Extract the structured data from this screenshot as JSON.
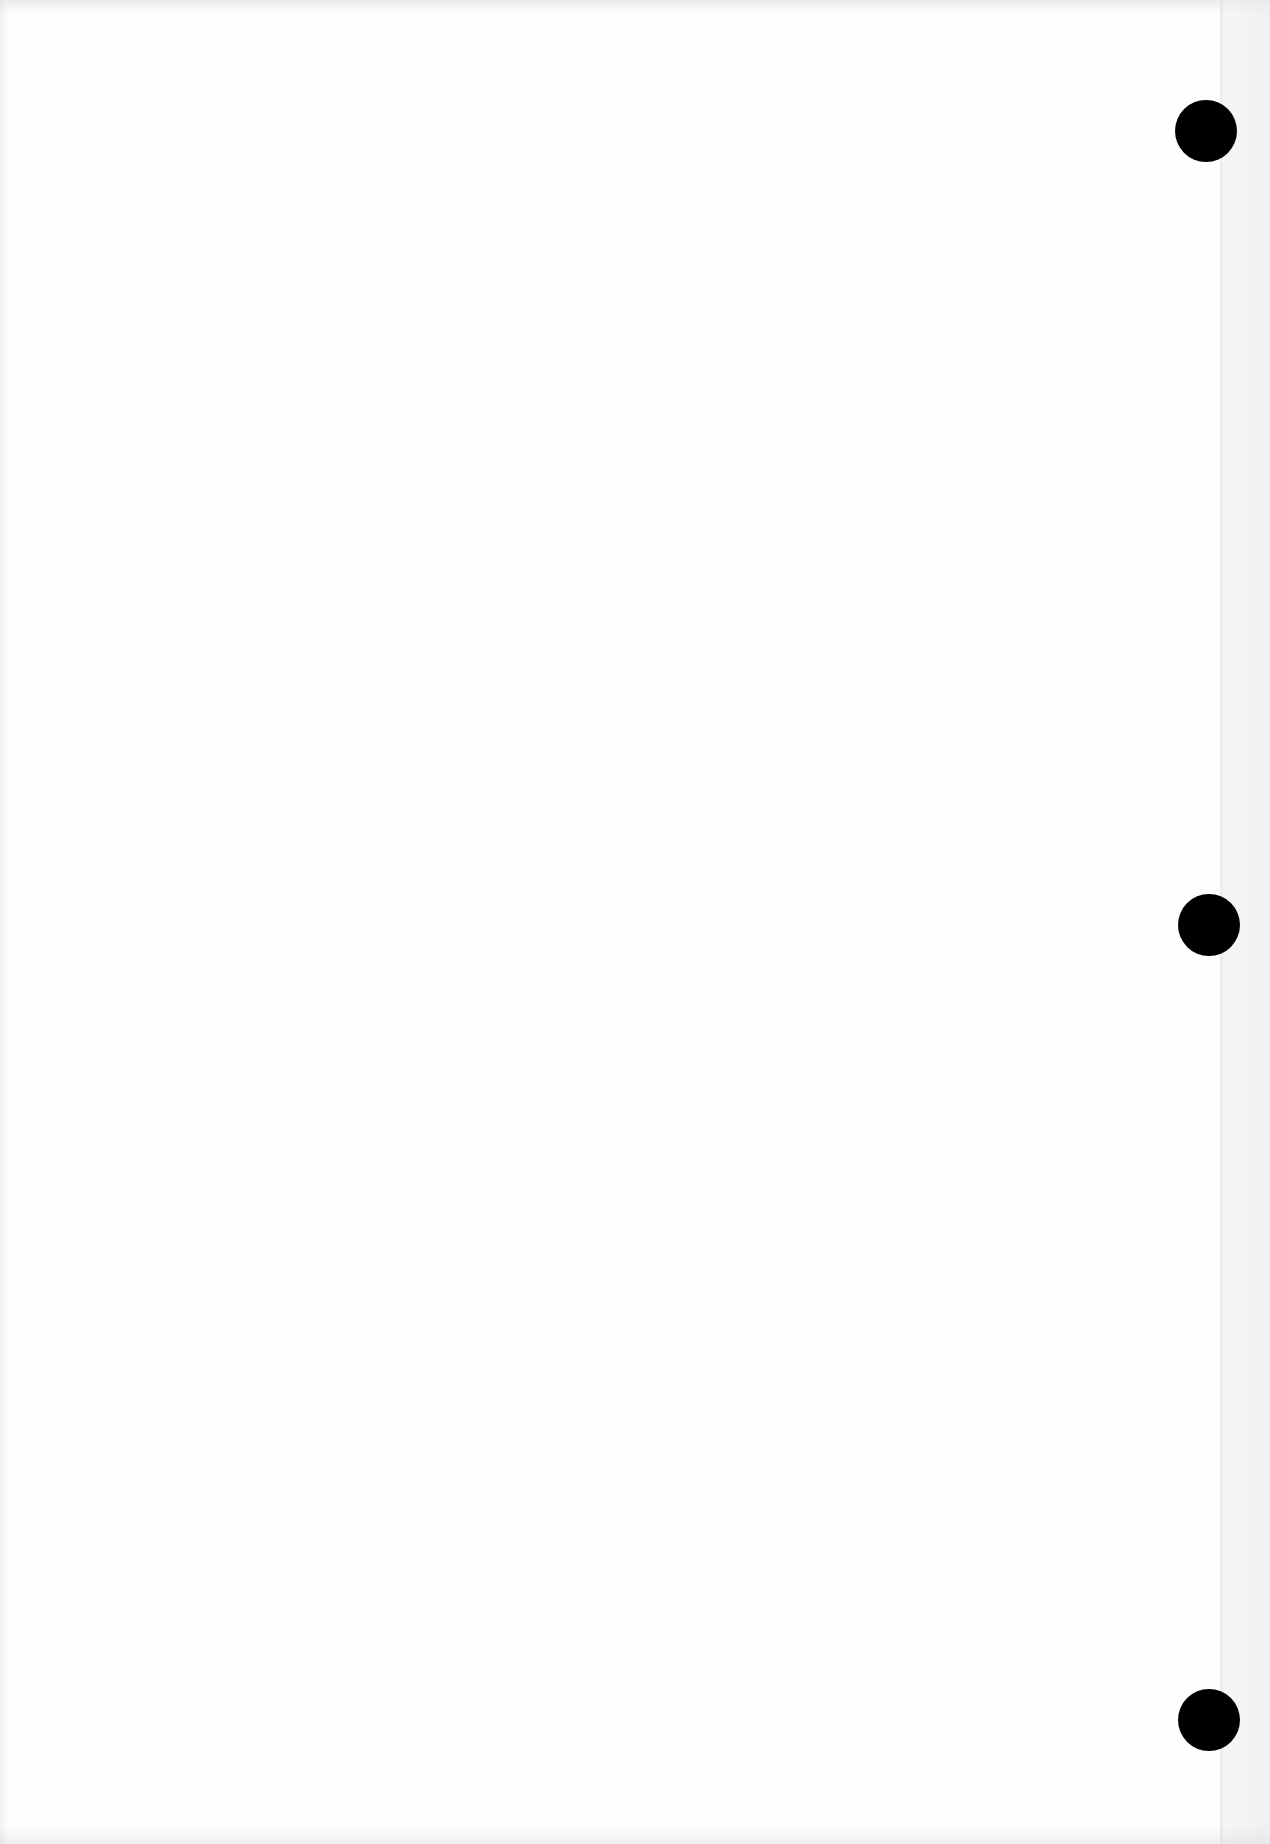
{
  "page": {
    "type": "blank scanned sheet",
    "background_color": "#fefefe",
    "text": ""
  },
  "punch_holes": [
    {
      "label": "top-hole",
      "cx": 1206,
      "cy": 131,
      "diameter": 62,
      "color": "#000000"
    },
    {
      "label": "middle-hole",
      "cx": 1209,
      "cy": 925,
      "diameter": 62,
      "color": "#000000"
    },
    {
      "label": "bottom-hole",
      "cx": 1209,
      "cy": 1720,
      "diameter": 62,
      "color": "#000000"
    }
  ]
}
